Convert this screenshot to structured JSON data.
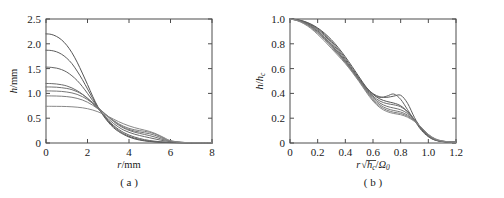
{
  "figure": {
    "background": "#ffffff",
    "panel_count": 2
  },
  "panel_a": {
    "caption": "( a )",
    "xlabel_var": "r",
    "xlabel_unit": "/mm",
    "ylabel_var": "h",
    "ylabel_unit": "/mm",
    "xticks": [
      "0",
      "2",
      "4",
      "6",
      "8"
    ],
    "yticks": [
      "0",
      "0.5",
      "1.0",
      "1.5",
      "2.0",
      "2.5"
    ]
  },
  "panel_b": {
    "caption": "( b )",
    "xlabel_var": "r",
    "xlabel_radicand": "h",
    "xlabel_radicand_sub": "c",
    "xlabel_denom": "Ω",
    "xlabel_denom_sub": "0",
    "ylabel_var": "h",
    "ylabel_denom": "h",
    "ylabel_denom_sub": "c",
    "xticks": [
      "0",
      "0.2",
      "0.4",
      "0.6",
      "0.8",
      "1.0",
      "1.2"
    ],
    "yticks": [
      "0",
      "0.2",
      "0.4",
      "0.6",
      "0.8",
      "1.0"
    ]
  },
  "chart_data": [
    {
      "type": "line",
      "panel": "a",
      "title": "",
      "xlabel": "r/mm",
      "ylabel": "h/mm",
      "xlim": [
        0,
        8
      ],
      "ylim": [
        0,
        2.5
      ],
      "xticks": [
        0,
        2,
        4,
        6,
        8
      ],
      "yticks": [
        0,
        0.5,
        1.0,
        1.5,
        2.0,
        2.5
      ],
      "grid": false,
      "legend": "none",
      "annotations": [
        "curves cross near r = 2.6 mm, h = 0.55 mm"
      ],
      "x": [
        0,
        0.25,
        0.5,
        0.75,
        1.0,
        1.25,
        1.5,
        1.75,
        2.0,
        2.25,
        2.5,
        2.75,
        3.0,
        3.25,
        3.5,
        3.75,
        4.0,
        4.25,
        4.5,
        4.75,
        5.0,
        5.25,
        5.5,
        5.75,
        6.0,
        6.5,
        7.0,
        7.5,
        8.0
      ],
      "series": [
        {
          "name": "curve-1",
          "color": "#555555",
          "h0": 2.2,
          "values": [
            2.2,
            2.19,
            2.15,
            2.08,
            1.97,
            1.82,
            1.63,
            1.41,
            1.18,
            0.94,
            0.73,
            0.56,
            0.42,
            0.31,
            0.23,
            0.17,
            0.12,
            0.085,
            0.06,
            0.042,
            0.03,
            0.021,
            0.015,
            0.011,
            0.008,
            0.005,
            0.004,
            0.003,
            0.003
          ]
        },
        {
          "name": "curve-2",
          "color": "#5c5c5c",
          "h0": 1.87,
          "values": [
            1.87,
            1.865,
            1.84,
            1.79,
            1.71,
            1.6,
            1.45,
            1.28,
            1.09,
            0.9,
            0.72,
            0.57,
            0.44,
            0.335,
            0.25,
            0.185,
            0.135,
            0.1,
            0.072,
            0.051,
            0.036,
            0.026,
            0.018,
            0.013,
            0.01,
            0.006,
            0.004,
            0.003,
            0.003
          ]
        },
        {
          "name": "curve-3",
          "color": "#636363",
          "h0": 1.53,
          "values": [
            1.53,
            1.525,
            1.51,
            1.48,
            1.43,
            1.355,
            1.26,
            1.14,
            1.0,
            0.855,
            0.71,
            0.575,
            0.455,
            0.355,
            0.275,
            0.21,
            0.16,
            0.122,
            0.092,
            0.068,
            0.05,
            0.036,
            0.026,
            0.018,
            0.013,
            0.007,
            0.005,
            0.004,
            0.003
          ]
        },
        {
          "name": "curve-4",
          "color": "#6a6a6a",
          "h0": 1.2,
          "values": [
            1.2,
            1.198,
            1.19,
            1.175,
            1.15,
            1.11,
            1.055,
            0.985,
            0.895,
            0.795,
            0.69,
            0.585,
            0.485,
            0.395,
            0.32,
            0.26,
            0.215,
            0.18,
            0.152,
            0.128,
            0.105,
            0.082,
            0.06,
            0.04,
            0.025,
            0.01,
            0.005,
            0.004,
            0.003
          ]
        },
        {
          "name": "curve-5",
          "color": "#707070",
          "h0": 1.13,
          "values": [
            1.13,
            1.129,
            1.125,
            1.115,
            1.1,
            1.075,
            1.035,
            0.98,
            0.905,
            0.815,
            0.72,
            0.62,
            0.525,
            0.435,
            0.36,
            0.3,
            0.255,
            0.22,
            0.195,
            0.172,
            0.148,
            0.12,
            0.088,
            0.056,
            0.032,
            0.012,
            0.006,
            0.004,
            0.003
          ]
        },
        {
          "name": "curve-6",
          "color": "#777777",
          "h0": 1.05,
          "values": [
            1.05,
            1.049,
            1.046,
            1.04,
            1.028,
            1.01,
            0.98,
            0.935,
            0.875,
            0.8,
            0.715,
            0.625,
            0.535,
            0.45,
            0.375,
            0.315,
            0.272,
            0.242,
            0.222,
            0.205,
            0.185,
            0.155,
            0.115,
            0.072,
            0.038,
            0.013,
            0.006,
            0.004,
            0.003
          ]
        },
        {
          "name": "curve-7",
          "color": "#7e7e7e",
          "h0": 0.95,
          "values": [
            0.95,
            0.949,
            0.947,
            0.943,
            0.935,
            0.922,
            0.9,
            0.868,
            0.822,
            0.762,
            0.69,
            0.612,
            0.532,
            0.455,
            0.388,
            0.335,
            0.295,
            0.268,
            0.25,
            0.235,
            0.215,
            0.182,
            0.136,
            0.085,
            0.043,
            0.014,
            0.006,
            0.004,
            0.003
          ]
        },
        {
          "name": "curve-8",
          "color": "#888888",
          "h0": 0.74,
          "values": [
            0.74,
            0.74,
            0.739,
            0.738,
            0.735,
            0.73,
            0.722,
            0.71,
            0.692,
            0.665,
            0.63,
            0.585,
            0.535,
            0.482,
            0.43,
            0.385,
            0.345,
            0.312,
            0.285,
            0.26,
            0.232,
            0.195,
            0.148,
            0.095,
            0.048,
            0.015,
            0.006,
            0.004,
            0.003
          ]
        }
      ]
    },
    {
      "type": "line",
      "panel": "b",
      "title": "",
      "xlabel": "r√hc/Ω0",
      "ylabel": "h/hc",
      "xlim": [
        0,
        1.2
      ],
      "ylim": [
        0,
        1.0
      ],
      "xticks": [
        0,
        0.2,
        0.4,
        0.6,
        0.8,
        1.0,
        1.2
      ],
      "yticks": [
        0,
        0.2,
        0.4,
        0.6,
        0.8,
        1.0
      ],
      "grid": false,
      "legend": "none",
      "annotations": [
        "curves collapse onto a common profile; fanned shoulder near x = 0.6-0.85"
      ],
      "x": [
        0,
        0.05,
        0.1,
        0.15,
        0.2,
        0.25,
        0.3,
        0.35,
        0.4,
        0.45,
        0.5,
        0.55,
        0.6,
        0.65,
        0.7,
        0.75,
        0.8,
        0.85,
        0.9,
        0.95,
        1.0,
        1.05,
        1.1,
        1.15,
        1.2
      ],
      "series": [
        {
          "name": "curve-1",
          "color": "#555555",
          "values": [
            1.0,
            0.995,
            0.982,
            0.96,
            0.928,
            0.885,
            0.832,
            0.768,
            0.695,
            0.615,
            0.532,
            0.452,
            0.392,
            0.355,
            0.335,
            0.322,
            0.3,
            0.252,
            0.182,
            0.11,
            0.055,
            0.024,
            0.012,
            0.008,
            0.006
          ]
        },
        {
          "name": "curve-2",
          "color": "#5c5c5c",
          "values": [
            1.0,
            0.994,
            0.98,
            0.956,
            0.922,
            0.876,
            0.82,
            0.755,
            0.682,
            0.602,
            0.522,
            0.448,
            0.398,
            0.372,
            0.368,
            0.378,
            0.385,
            0.32,
            0.205,
            0.115,
            0.056,
            0.025,
            0.013,
            0.008,
            0.006
          ]
        },
        {
          "name": "curve-3",
          "color": "#636363",
          "values": [
            1.0,
            0.993,
            0.977,
            0.951,
            0.914,
            0.866,
            0.808,
            0.742,
            0.67,
            0.592,
            0.515,
            0.444,
            0.392,
            0.368,
            0.378,
            0.395,
            0.352,
            0.268,
            0.182,
            0.102,
            0.05,
            0.022,
            0.012,
            0.008,
            0.006
          ]
        },
        {
          "name": "curve-4",
          "color": "#6a6a6a",
          "values": [
            1.0,
            0.992,
            0.974,
            0.945,
            0.905,
            0.855,
            0.795,
            0.73,
            0.66,
            0.585,
            0.51,
            0.438,
            0.378,
            0.338,
            0.318,
            0.308,
            0.292,
            0.252,
            0.19,
            0.118,
            0.058,
            0.026,
            0.013,
            0.008,
            0.006
          ]
        },
        {
          "name": "curve-5",
          "color": "#707070",
          "values": [
            1.0,
            0.991,
            0.972,
            0.942,
            0.9,
            0.85,
            0.79,
            0.726,
            0.658,
            0.584,
            0.508,
            0.432,
            0.368,
            0.322,
            0.296,
            0.282,
            0.268,
            0.238,
            0.188,
            0.122,
            0.062,
            0.028,
            0.014,
            0.008,
            0.006
          ]
        },
        {
          "name": "curve-6",
          "color": "#777777",
          "values": [
            1.0,
            0.99,
            0.969,
            0.937,
            0.893,
            0.842,
            0.782,
            0.718,
            0.652,
            0.58,
            0.504,
            0.426,
            0.358,
            0.308,
            0.278,
            0.262,
            0.25,
            0.225,
            0.182,
            0.124,
            0.065,
            0.03,
            0.015,
            0.009,
            0.006
          ]
        },
        {
          "name": "curve-7",
          "color": "#7e7e7e",
          "values": [
            1.0,
            0.989,
            0.966,
            0.932,
            0.886,
            0.834,
            0.774,
            0.712,
            0.648,
            0.576,
            0.5,
            0.42,
            0.348,
            0.296,
            0.265,
            0.248,
            0.238,
            0.216,
            0.178,
            0.126,
            0.068,
            0.032,
            0.016,
            0.009,
            0.006
          ]
        },
        {
          "name": "curve-8",
          "color": "#888888",
          "values": [
            1.0,
            0.987,
            0.962,
            0.925,
            0.876,
            0.822,
            0.762,
            0.702,
            0.64,
            0.57,
            0.494,
            0.412,
            0.338,
            0.285,
            0.254,
            0.238,
            0.228,
            0.208,
            0.174,
            0.126,
            0.07,
            0.034,
            0.017,
            0.01,
            0.006
          ]
        }
      ]
    }
  ]
}
